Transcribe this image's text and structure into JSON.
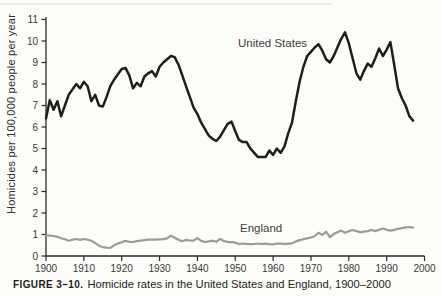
{
  "figure": {
    "caption_prefix": "FIGURE 3–10.",
    "caption_text": "Homicide rates in the United States and England, 1900–2000"
  },
  "chart_data": {
    "type": "line",
    "title": "",
    "xlabel": "",
    "ylabel": "Homicides per 100,000 people per year",
    "x_range": [
      1900,
      2000
    ],
    "ylim": [
      0,
      11
    ],
    "grid": false,
    "legend": "inline-labels",
    "x_ticks": [
      1900,
      1910,
      1920,
      1930,
      1940,
      1950,
      1960,
      1970,
      1980,
      1990,
      2000
    ],
    "y_ticks": [
      0,
      1,
      2,
      3,
      4,
      5,
      6,
      7,
      8,
      9,
      10,
      11
    ],
    "x": [
      1900,
      1901,
      1902,
      1903,
      1904,
      1905,
      1906,
      1907,
      1908,
      1909,
      1910,
      1911,
      1912,
      1913,
      1914,
      1915,
      1916,
      1917,
      1918,
      1919,
      1920,
      1921,
      1922,
      1923,
      1924,
      1925,
      1926,
      1927,
      1928,
      1929,
      1930,
      1931,
      1932,
      1933,
      1934,
      1935,
      1936,
      1937,
      1938,
      1939,
      1940,
      1941,
      1942,
      1943,
      1944,
      1945,
      1946,
      1947,
      1948,
      1949,
      1950,
      1951,
      1952,
      1953,
      1954,
      1955,
      1956,
      1957,
      1958,
      1959,
      1960,
      1961,
      1962,
      1963,
      1964,
      1965,
      1966,
      1967,
      1968,
      1969,
      1970,
      1971,
      1972,
      1973,
      1974,
      1975,
      1976,
      1977,
      1978,
      1979,
      1980,
      1981,
      1982,
      1983,
      1984,
      1985,
      1986,
      1987,
      1988,
      1989,
      1990,
      1991,
      1992,
      1993,
      1994,
      1995,
      1996,
      1997
    ],
    "series": [
      {
        "name": "United States",
        "color": "#1e1e1e",
        "values": [
          6.4,
          7.25,
          6.8,
          7.2,
          6.5,
          7.0,
          7.5,
          7.75,
          8.0,
          7.8,
          8.1,
          7.9,
          7.2,
          7.5,
          7.0,
          6.95,
          7.4,
          7.9,
          8.2,
          8.45,
          8.7,
          8.75,
          8.4,
          7.8,
          8.05,
          7.9,
          8.35,
          8.5,
          8.6,
          8.35,
          8.8,
          9.0,
          9.15,
          9.3,
          9.25,
          8.9,
          8.4,
          7.9,
          7.4,
          6.9,
          6.6,
          6.2,
          5.9,
          5.6,
          5.45,
          5.35,
          5.55,
          5.85,
          6.15,
          6.25,
          5.8,
          5.4,
          5.3,
          5.3,
          5.0,
          4.8,
          4.6,
          4.6,
          4.6,
          4.9,
          4.7,
          5.0,
          4.8,
          5.1,
          5.7,
          6.2,
          7.2,
          8.1,
          8.8,
          9.3,
          9.5,
          9.7,
          9.85,
          9.55,
          9.15,
          9.0,
          9.3,
          9.7,
          10.1,
          10.4,
          9.9,
          9.2,
          8.5,
          8.2,
          8.6,
          8.95,
          8.8,
          9.2,
          9.65,
          9.3,
          9.6,
          9.95,
          8.9,
          7.8,
          7.35,
          7.0,
          6.5,
          6.3
        ]
      },
      {
        "name": "England",
        "color": "#9b9b9b",
        "values": [
          0.96,
          0.95,
          0.93,
          0.89,
          0.83,
          0.78,
          0.71,
          0.76,
          0.79,
          0.75,
          0.79,
          0.76,
          0.71,
          0.6,
          0.48,
          0.41,
          0.39,
          0.38,
          0.5,
          0.58,
          0.64,
          0.7,
          0.66,
          0.65,
          0.69,
          0.71,
          0.74,
          0.76,
          0.76,
          0.76,
          0.77,
          0.78,
          0.82,
          0.95,
          0.85,
          0.76,
          0.69,
          0.75,
          0.72,
          0.71,
          0.83,
          0.7,
          0.65,
          0.68,
          0.71,
          0.66,
          0.8,
          0.69,
          0.66,
          0.64,
          0.62,
          0.56,
          0.58,
          0.56,
          0.55,
          0.56,
          0.58,
          0.56,
          0.57,
          0.55,
          0.54,
          0.57,
          0.58,
          0.55,
          0.57,
          0.59,
          0.68,
          0.74,
          0.78,
          0.82,
          0.86,
          0.92,
          1.08,
          0.98,
          1.13,
          0.88,
          1.02,
          1.1,
          1.18,
          1.08,
          1.15,
          1.21,
          1.16,
          1.1,
          1.13,
          1.16,
          1.21,
          1.16,
          1.22,
          1.28,
          1.22,
          1.18,
          1.22,
          1.26,
          1.3,
          1.33,
          1.35,
          1.32
        ]
      }
    ]
  },
  "colors": {
    "background": "#fcfcf9",
    "axis": "#2b2b2b",
    "us_line": "#1e1e1e",
    "england_line": "#9b9b9b"
  }
}
